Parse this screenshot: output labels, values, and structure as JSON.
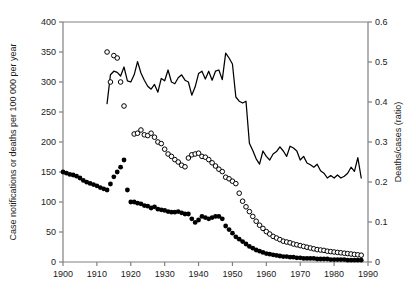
{
  "chart_data": {
    "type": "line",
    "title": "",
    "subtitle": "",
    "xlabel": "",
    "ylabel": "Case notifications or deaths per 100 000 per year",
    "y2label": "Deaths/cases (ratio)",
    "xlim": [
      1900,
      1990
    ],
    "ylim": [
      0,
      400
    ],
    "y2lim": [
      0,
      0.6
    ],
    "xticks": [
      1900,
      1910,
      1920,
      1930,
      1940,
      1950,
      1960,
      1970,
      1980,
      1990
    ],
    "xticklabels": [
      "1900",
      "1910",
      "1920",
      "1930",
      "1940",
      "1950",
      "1960",
      "1970",
      "1980",
      "1990"
    ],
    "yticks": [
      0,
      50,
      100,
      150,
      200,
      250,
      300,
      350,
      400
    ],
    "yticklabels": [
      "0",
      "50",
      "100",
      "150",
      "200",
      "250",
      "300",
      "350",
      "400"
    ],
    "y2ticks": [
      0,
      0.1,
      0.2,
      0.3,
      0.4,
      0.5,
      0.6
    ],
    "y2ticklabels": [
      "0",
      "0.1",
      "0.2",
      "0.3",
      "0.4",
      "0.5",
      "0.6"
    ],
    "grid": false,
    "legend": null,
    "legend_position": "none",
    "colors": {
      "line": "#000000",
      "filled_marker": "#000000",
      "open_marker_edge": "#000000",
      "axis": "#808080",
      "text": "#1a1a1a",
      "background": "#ffffff"
    },
    "series": [
      {
        "name": "Case notifications per 100 000 per year",
        "axis": "left",
        "style": "line",
        "marker": "none",
        "x": [
          1913,
          1914,
          1915,
          1916,
          1917,
          1918,
          1919,
          1920,
          1921,
          1922,
          1923,
          1924,
          1925,
          1926,
          1927,
          1928,
          1929,
          1930,
          1931,
          1932,
          1933,
          1934,
          1935,
          1936,
          1937,
          1938,
          1939,
          1940,
          1941,
          1942,
          1943,
          1944,
          1945,
          1946,
          1947,
          1948,
          1949,
          1950,
          1951,
          1952,
          1953,
          1954,
          1955,
          1956,
          1957,
          1958,
          1959,
          1960,
          1961,
          1962,
          1963,
          1964,
          1965,
          1966,
          1967,
          1968,
          1969,
          1970,
          1971,
          1972,
          1973,
          1974,
          1975,
          1976,
          1977,
          1978,
          1979,
          1980,
          1981,
          1982,
          1983,
          1984,
          1985,
          1986,
          1987,
          1988
        ],
        "y": [
          264,
          312,
          318,
          316,
          310,
          325,
          302,
          300,
          312,
          334,
          315,
          303,
          293,
          288,
          296,
          283,
          306,
          302,
          320,
          300,
          297,
          307,
          312,
          303,
          300,
          278,
          292,
          314,
          318,
          305,
          318,
          303,
          318,
          320,
          304,
          348,
          340,
          330,
          275,
          268,
          265,
          268,
          198,
          186,
          172,
          163,
          185,
          176,
          170,
          180,
          184,
          192,
          185,
          176,
          193,
          190,
          185,
          170,
          176,
          165,
          162,
          158,
          163,
          152,
          148,
          140,
          144,
          140,
          145,
          140,
          143,
          148,
          158,
          151,
          174,
          140
        ]
      },
      {
        "name": "Deaths per 100 000 per year",
        "axis": "left",
        "style": "markers",
        "marker": "filled-circle",
        "x": [
          1900,
          1901,
          1902,
          1903,
          1904,
          1905,
          1906,
          1907,
          1908,
          1909,
          1910,
          1911,
          1912,
          1913,
          1914,
          1915,
          1916,
          1917,
          1918,
          1919,
          1920,
          1921,
          1922,
          1923,
          1924,
          1925,
          1926,
          1927,
          1928,
          1929,
          1930,
          1931,
          1932,
          1933,
          1934,
          1935,
          1936,
          1937,
          1938,
          1939,
          1940,
          1941,
          1942,
          1943,
          1944,
          1945,
          1946,
          1947,
          1948,
          1949,
          1950,
          1951,
          1952,
          1953,
          1954,
          1955,
          1956,
          1957,
          1958,
          1959,
          1960,
          1961,
          1962,
          1963,
          1964,
          1965,
          1966,
          1967,
          1968,
          1969,
          1970,
          1971,
          1972,
          1973,
          1974,
          1975,
          1976,
          1977,
          1978,
          1979,
          1980,
          1981,
          1982,
          1983,
          1984,
          1985,
          1986,
          1987,
          1988
        ],
        "y": [
          150,
          148,
          146,
          145,
          143,
          140,
          136,
          133,
          131,
          129,
          127,
          124,
          122,
          120,
          130,
          142,
          150,
          158,
          170,
          120,
          100,
          100,
          98,
          97,
          94,
          93,
          90,
          92,
          88,
          87,
          86,
          84,
          83,
          83,
          84,
          82,
          80,
          80,
          72,
          66,
          70,
          76,
          74,
          72,
          74,
          76,
          76,
          72,
          60,
          54,
          48,
          42,
          38,
          34,
          30,
          26,
          23,
          20,
          18,
          16,
          14,
          13,
          12,
          11,
          10,
          9,
          9,
          8,
          8,
          7,
          7,
          6,
          6,
          6,
          6,
          5,
          5,
          5,
          5,
          4,
          4,
          4,
          4,
          4,
          3,
          3,
          3,
          3,
          3
        ]
      },
      {
        "name": "Deaths/cases (ratio)",
        "axis": "right",
        "style": "markers",
        "marker": "open-circle",
        "x": [
          1913,
          1914,
          1915,
          1916,
          1917,
          1918,
          1921,
          1922,
          1923,
          1924,
          1925,
          1926,
          1927,
          1928,
          1929,
          1930,
          1931,
          1932,
          1933,
          1934,
          1935,
          1936,
          1937,
          1938,
          1939,
          1940,
          1941,
          1942,
          1943,
          1944,
          1945,
          1946,
          1947,
          1948,
          1949,
          1950,
          1951,
          1952,
          1953,
          1954,
          1955,
          1956,
          1957,
          1958,
          1959,
          1960,
          1961,
          1962,
          1963,
          1964,
          1965,
          1966,
          1967,
          1968,
          1969,
          1970,
          1971,
          1972,
          1973,
          1974,
          1975,
          1976,
          1977,
          1978,
          1979,
          1980,
          1981,
          1982,
          1983,
          1984,
          1985,
          1986,
          1987,
          1988
        ],
        "y": [
          0.525,
          0.45,
          0.516,
          0.51,
          0.45,
          0.39,
          0.32,
          0.322,
          0.33,
          0.318,
          0.316,
          0.322,
          0.312,
          0.3,
          0.296,
          0.282,
          0.27,
          0.264,
          0.256,
          0.25,
          0.242,
          0.238,
          0.26,
          0.268,
          0.27,
          0.272,
          0.264,
          0.262,
          0.256,
          0.248,
          0.24,
          0.232,
          0.226,
          0.212,
          0.208,
          0.202,
          0.196,
          0.172,
          0.152,
          0.138,
          0.126,
          0.114,
          0.102,
          0.092,
          0.084,
          0.076,
          0.07,
          0.064,
          0.06,
          0.056,
          0.052,
          0.05,
          0.048,
          0.045,
          0.043,
          0.041,
          0.039,
          0.037,
          0.035,
          0.033,
          0.031,
          0.03,
          0.029,
          0.027,
          0.026,
          0.025,
          0.024,
          0.023,
          0.022,
          0.021,
          0.02,
          0.019,
          0.018,
          0.017
        ]
      }
    ]
  }
}
